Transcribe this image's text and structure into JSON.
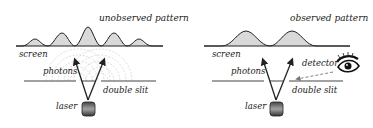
{
  "left_panel": {
    "title": "unobserved pattern",
    "screen_label": "screen",
    "photons_label": "photons",
    "slit_label": "double slit",
    "laser_label": "laser",
    "peak_count": 5
  },
  "right_panel": {
    "title": "observed pattern",
    "screen_label": "screen",
    "photons_label": "photons",
    "detector_label": "detector",
    "slit_label": "double slit",
    "laser_label": "laser",
    "peak_count": 2
  },
  "icons": {
    "detector": "eye-icon",
    "source": "laser-icon"
  },
  "colors": {
    "line": "#222222",
    "peak_fill": "#d9d9d9",
    "wave": "#cfcfcf",
    "laser_body": "#555555"
  }
}
